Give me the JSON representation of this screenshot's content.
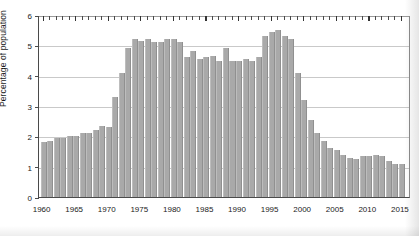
{
  "chart_data": {
    "type": "bar",
    "title": "",
    "subtitle": "",
    "xlabel": "",
    "ylabel": "Percentage of population",
    "ylim": [
      0,
      6
    ],
    "xlim": [
      1960,
      2015
    ],
    "ytick_labels": [
      "0",
      "1",
      "2",
      "3",
      "4",
      "5",
      "6"
    ],
    "ytick_values": [
      0,
      1,
      2,
      3,
      4,
      5,
      6
    ],
    "xtick_labels": [
      "1960",
      "1965",
      "1970",
      "1975",
      "1980",
      "1985",
      "1990",
      "1995",
      "2000",
      "2005",
      "2010",
      "2015"
    ],
    "xtick_values": [
      1960,
      1965,
      1970,
      1975,
      1980,
      1985,
      1990,
      1995,
      2000,
      2005,
      2010,
      2015
    ],
    "minor_xticks_every": 1,
    "grid": "horizontal",
    "legend": "none",
    "bar_color": "#a9a9a9",
    "axis_color": "#4a4a4a",
    "gridline_color": "#c9c9c9",
    "categories": [
      1960,
      1961,
      1962,
      1963,
      1964,
      1965,
      1966,
      1967,
      1968,
      1969,
      1970,
      1971,
      1972,
      1973,
      1974,
      1975,
      1976,
      1977,
      1978,
      1979,
      1980,
      1981,
      1982,
      1983,
      1984,
      1985,
      1986,
      1987,
      1988,
      1989,
      1990,
      1991,
      1992,
      1993,
      1994,
      1995,
      1996,
      1997,
      1998,
      1999,
      2000,
      2001,
      2002,
      2003,
      2004,
      2005,
      2006,
      2007,
      2008,
      2009,
      2010,
      2011,
      2012,
      2013,
      2014,
      2015
    ],
    "values": [
      1.8,
      1.85,
      1.95,
      1.95,
      2.0,
      2.0,
      2.1,
      2.1,
      2.2,
      2.35,
      2.3,
      3.3,
      4.1,
      4.9,
      5.2,
      5.15,
      5.2,
      5.1,
      5.1,
      5.2,
      5.2,
      5.1,
      4.6,
      4.8,
      4.55,
      4.6,
      4.65,
      4.5,
      4.9,
      4.5,
      4.5,
      4.55,
      4.5,
      4.6,
      5.3,
      5.45,
      5.5,
      5.3,
      5.2,
      4.1,
      3.2,
      2.55,
      2.1,
      1.85,
      1.6,
      1.55,
      1.4,
      1.3,
      1.25,
      1.35,
      1.35,
      1.4,
      1.35,
      1.2,
      1.1,
      1.1
    ]
  }
}
